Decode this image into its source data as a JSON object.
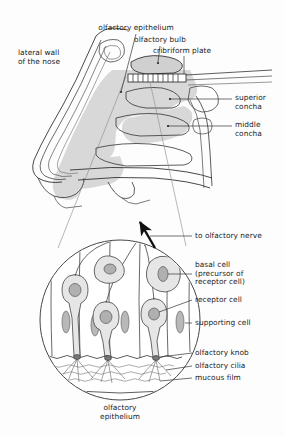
{
  "figure": {
    "type": "anatomical-diagram",
    "background_color": "#fdfdfd",
    "ink_color": "#1a1a1a",
    "tissue_fill": "#d8d8d8",
    "cell_fill": "#e3e3e3",
    "nucleus_fill": "#b8b8b8"
  },
  "upper_view": {
    "name": "sagittal-section-of-nasal-cavity",
    "labels": {
      "lateral_wall": "lateral wall\nof the nose",
      "olfactory_epithelium": "olfactory epithelium",
      "olfactory_bulb": "olfactory bulb",
      "cribriform_plate": "cribriform plate",
      "superior_concha": "superior\nconcha",
      "middle_concha": "middle\nconcha"
    }
  },
  "detail_view": {
    "name": "magnified-olfactory-epithelium",
    "caption": "olfactory\nepithelium",
    "labels": {
      "to_olfactory_nerve": "to olfactory nerve",
      "basal_cell": "basal cell\n(precursor of\nreceptor cell)",
      "receptor_cell": "receptor cell",
      "supporting_cell": "supporting cell",
      "olfactory_knob": "olfactory knob",
      "olfactory_cilia": "olfactory cilia",
      "mucous_film": "mucous film"
    }
  }
}
